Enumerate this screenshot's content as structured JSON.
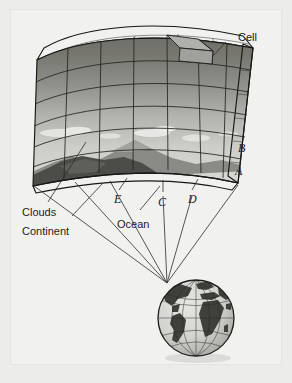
{
  "figure": {
    "background_color": "#ececeb",
    "panel_color": "#f1f1f0"
  },
  "labels": {
    "cell": "Cell",
    "clouds": "Clouds",
    "continent": "Continent",
    "ocean": "Ocean",
    "layer_b": "B",
    "layer_a": "A",
    "point_e": "E",
    "point_c": "C",
    "point_d": "D"
  },
  "slab": {
    "description": "Curved three-dimensional grid block of the atmosphere",
    "columns": 7,
    "rows": 6,
    "layers": [
      {
        "name": "stratosphere-top",
        "color": "#6f6f6c"
      },
      {
        "name": "upper-atmosphere",
        "color": "#7d7d7a"
      },
      {
        "name": "mid-atmosphere",
        "color": "#92928f"
      },
      {
        "name": "cloud-layer",
        "color": "#b9b9b6"
      },
      {
        "name": "lower-atmosphere",
        "color": "#cfcfcc"
      },
      {
        "name": "surface-layer",
        "color": "#dededb"
      }
    ],
    "surface": {
      "continent_color": "#4a4a46",
      "mountain_color": "#7a7a76",
      "ocean_color": "#c8c8c5",
      "cloud_color": "#e6e6e3"
    },
    "side_face_color": "#8c8c89",
    "top_face_color": "#a3a3a0"
  },
  "globe": {
    "name": "earth-globe",
    "ocean_color": "#d8d8d5",
    "land_color": "#3d3d39",
    "graticule_color": "#2b2b28",
    "latitude_lines": 7,
    "longitude_lines": 7
  },
  "leader_lines": {
    "count": 7,
    "converge_x": 167,
    "converge_y": 283
  }
}
